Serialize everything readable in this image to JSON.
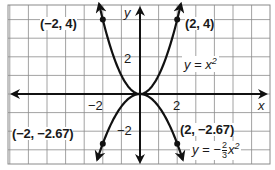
{
  "chart_data": {
    "type": "line",
    "title": "",
    "xlabel": "x",
    "ylabel": "y",
    "xlim": [
      -7,
      7
    ],
    "ylim": [
      -3.8,
      4.9
    ],
    "grid": true,
    "grid_step": 1,
    "x_ticks": [
      {
        "value": -2,
        "label": "−2"
      },
      {
        "value": 2,
        "label": "2"
      }
    ],
    "y_ticks": [
      {
        "value": 2,
        "label": "2"
      },
      {
        "value": -2,
        "label": "−2"
      }
    ],
    "series": [
      {
        "name": "y = x²",
        "equation": "y = x^2",
        "coefficient": 1,
        "domain": [
          -2.2,
          2.2
        ],
        "points": [
          {
            "x": -2,
            "y": 4,
            "label": "(−2, 4)"
          },
          {
            "x": 2,
            "y": 4,
            "label": "(2, 4)"
          }
        ]
      },
      {
        "name": "y = −(2/3)x²",
        "equation": "y = -(2/3)x^2",
        "coefficient": -0.6667,
        "domain": [
          -2.3,
          2.3
        ],
        "points": [
          {
            "x": -2,
            "y": -2.67,
            "label": "(−2, −2.67)"
          },
          {
            "x": 2,
            "y": -2.67,
            "label": "(2, −2.67)"
          }
        ]
      }
    ],
    "colors": {
      "grid": "#8a8a8a",
      "axis": "#111111",
      "curve": "#111111",
      "background": "#ffffff"
    }
  },
  "labels": {
    "axis_x": "x",
    "axis_y": "y",
    "tick_x_neg": "−2",
    "tick_x_pos": "2",
    "tick_y_pos": "2",
    "tick_y_neg": "−2",
    "point_tl": "(−2, 4)",
    "point_tr": "(2, 4)",
    "point_bl": "(−2, −2.67)",
    "point_br": "(2, −2.67)",
    "eq1_lhs": "y = x",
    "eq1_exp": "2",
    "eq2_lhs": "y = −",
    "eq2_num": "2",
    "eq2_den": "3",
    "eq2_var": "x",
    "eq2_exp": "2"
  }
}
